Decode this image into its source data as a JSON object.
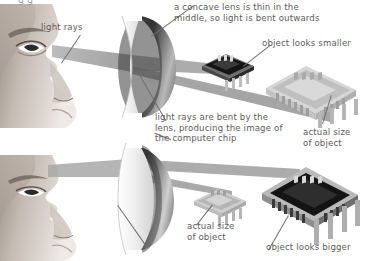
{
  "figure": {
    "title_fragment_clipped": "g g",
    "domain": "optics-diagram",
    "background_color": "#ffffff",
    "text_color": "#5c5c5c",
    "line_color": "#6f6f6f",
    "beam_color": "#9b9b9b"
  },
  "panels": [
    {
      "id": "concave",
      "lens_type": "concave",
      "labels": {
        "light_rays": "light rays",
        "lens_description": "a concave lens is thin in the\nmiddle, so light is bent outwards",
        "image_label": "object looks smaller",
        "object_label": "actual size\nof object"
      }
    },
    {
      "id": "convex",
      "lens_type": "convex",
      "labels": {
        "lens_description": "light rays are bent by the\nlens, producing the image of\nthe computer chip",
        "image_label": "object looks bigger",
        "object_label": "actual size\nof object"
      }
    }
  ],
  "objects": {
    "small_dark_chip": "computer-chip-small-dark",
    "large_light_chip": "computer-chip-large-light",
    "small_light_chip": "computer-chip-small-light",
    "large_dark_chip": "computer-chip-large-dark"
  },
  "colors": {
    "chip_dark_body": "#1c1c1c",
    "chip_light_body": "#c9c9c9",
    "chip_pin": "#a8a8a8",
    "lens_glass": "#f2f2f2",
    "lens_disc_dark": "#3a3a3a",
    "skin_light": "#d9d2cc",
    "skin_mid": "#b5aaa2",
    "skin_dark": "#7d736c"
  }
}
